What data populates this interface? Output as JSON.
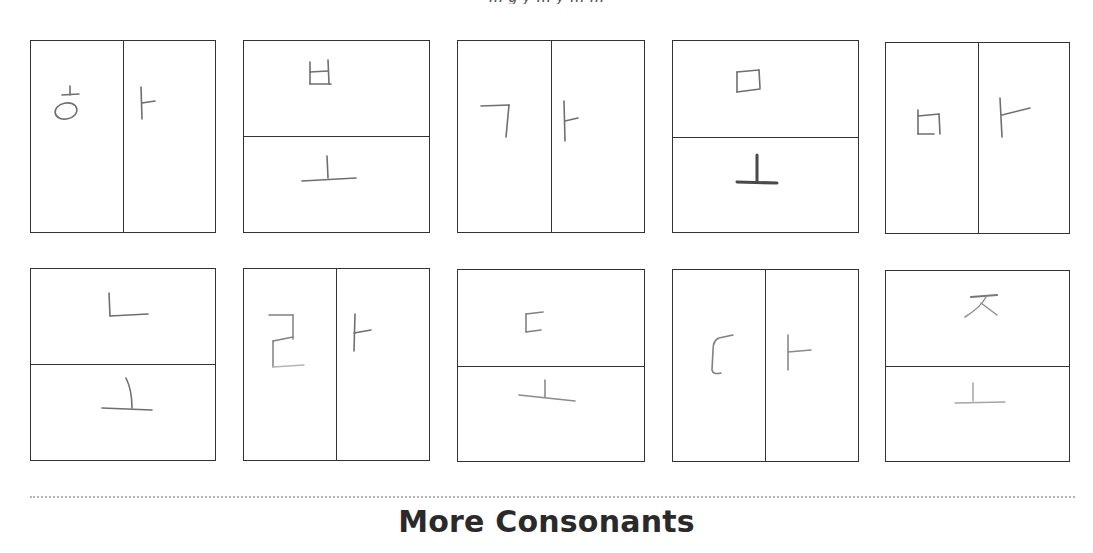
{
  "page": {
    "top_text_fragment": "… g y … y … …",
    "heading": "More Consonants",
    "colors": {
      "box_border": "#333333",
      "pencil": "#6f6f6f",
      "divider_dotted": "#b5b5b5",
      "heading": "#2a2a2a"
    }
  },
  "boxes": [
    {
      "row": 1,
      "col": 1,
      "split": "vertical",
      "syllable": "하",
      "parts": [
        "ㅎ",
        "ㅏ"
      ]
    },
    {
      "row": 1,
      "col": 2,
      "split": "horizontal",
      "syllable": "보",
      "parts": [
        "ㅂ",
        "ㅗ"
      ]
    },
    {
      "row": 1,
      "col": 3,
      "split": "vertical",
      "syllable": "가",
      "parts": [
        "ㄱ",
        "ㅏ"
      ]
    },
    {
      "row": 1,
      "col": 4,
      "split": "horizontal",
      "syllable": "모",
      "parts": [
        "ㅁ",
        "ㅗ"
      ]
    },
    {
      "row": 1,
      "col": 5,
      "split": "vertical",
      "syllable": "마",
      "parts": [
        "ㅁ",
        "ㅏ"
      ]
    },
    {
      "row": 2,
      "col": 1,
      "split": "horizontal",
      "syllable": "노",
      "parts": [
        "ㄴ",
        "ㅗ"
      ]
    },
    {
      "row": 2,
      "col": 2,
      "split": "vertical",
      "syllable": "라",
      "parts": [
        "ㄹ",
        "ㅏ"
      ]
    },
    {
      "row": 2,
      "col": 3,
      "split": "horizontal",
      "syllable": "도",
      "parts": [
        "ㄷ",
        "ㅗ"
      ]
    },
    {
      "row": 2,
      "col": 4,
      "split": "vertical",
      "syllable": "다",
      "parts": [
        "ㄷ",
        "ㅏ"
      ]
    },
    {
      "row": 2,
      "col": 5,
      "split": "horizontal",
      "syllable": "조",
      "parts": [
        "ㅈ",
        "ㅗ"
      ]
    }
  ]
}
